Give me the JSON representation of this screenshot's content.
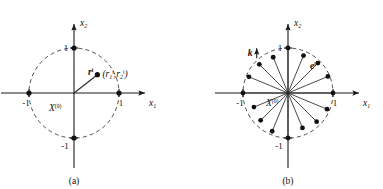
{
  "figure": {
    "type": "math-diagram",
    "background": "#ffffff",
    "ink_color": "#111111",
    "width": 383,
    "height": 189,
    "panels": [
      {
        "id": "a",
        "caption": "(a)",
        "center": {
          "x": 74,
          "y": 93
        },
        "radius": 45,
        "axes": {
          "x_label": "x",
          "x_label_sub": "1",
          "y_label": "x",
          "y_label_sub": "2"
        },
        "tick_labels": {
          "x_pos": "1",
          "x_neg": "-1",
          "y_pos": "1",
          "y_neg": "-1"
        },
        "origin_label": "X",
        "origin_label_sup": "(0)",
        "vector_label": "r",
        "vector_label_sup": "i",
        "point_label": "(r",
        "point_label_parts": {
          "open": "(",
          "r1": "r",
          "sub1": "1",
          "sup1": "i",
          "comma": ",",
          "r2": "r",
          "sub2": "2",
          "sup2": "i",
          "close": ")"
        },
        "point": {
          "angle_deg": 38,
          "radius_frac": 0.66
        },
        "dots_on_axes": [
          {
            "x": 1,
            "y": 0
          },
          {
            "x": -1,
            "y": 0
          },
          {
            "x": 0,
            "y": 1
          },
          {
            "x": 0,
            "y": -1
          }
        ]
      },
      {
        "id": "b",
        "caption": "(b)",
        "center": {
          "x": 288,
          "y": 93
        },
        "radius": 45,
        "axes": {
          "x_label": "x",
          "x_label_sub": "1",
          "y_label": "x",
          "y_label_sub": "2"
        },
        "tick_labels": {
          "x_pos": "1",
          "x_neg": "-1",
          "y_pos": "1",
          "y_neg": "-1"
        },
        "origin_label": "X",
        "origin_label_sup": "(0)",
        "direction_label": "k",
        "unit_vector_label": "e",
        "unit_vector_label_sup": "i",
        "vector_count": 16,
        "vector_angles_deg": [
          0,
          22.5,
          45,
          67.5,
          90,
          112.5,
          135,
          157.5,
          180,
          202.5,
          225,
          247.5,
          270,
          292.5,
          315,
          337.5
        ],
        "vector_radius_frac": [
          1.0,
          0.96,
          0.94,
          0.9,
          1.0,
          0.86,
          0.9,
          0.94,
          1.0,
          0.82,
          0.86,
          0.92,
          1.0,
          0.84,
          0.9,
          0.94
        ]
      }
    ]
  }
}
